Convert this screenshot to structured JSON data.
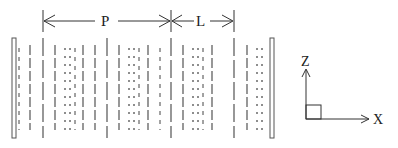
{
  "diagram": {
    "type": "periodic-layered-structure-schematic",
    "dimension_labels": {
      "period": "P",
      "layer": "L"
    },
    "axes": {
      "vertical": "Z",
      "horizontal": "X"
    },
    "colors": {
      "stroke": "#333333",
      "plate": "#555555",
      "background": "#ffffff"
    },
    "structure": {
      "left_plate_x": 14,
      "right_plate_x": 272,
      "plate_top": 38,
      "plate_bottom": 138,
      "dimension_line_y": 21,
      "tall_markers_x": [
        43,
        107,
        171,
        234
      ],
      "columns": [
        {
          "x": 19,
          "style": "short-dash"
        },
        {
          "x": 30,
          "style": "long-dash"
        },
        {
          "x": 43,
          "style": "long-dash"
        },
        {
          "x": 55,
          "style": "long-dash"
        },
        {
          "x": 65,
          "style": "dot"
        },
        {
          "x": 70,
          "style": "dot"
        },
        {
          "x": 75,
          "style": "short-dash"
        },
        {
          "x": 83,
          "style": "long-dash"
        },
        {
          "x": 95,
          "style": "long-dash"
        },
        {
          "x": 107,
          "style": "long-dash"
        },
        {
          "x": 119,
          "style": "long-dash"
        },
        {
          "x": 129,
          "style": "dot"
        },
        {
          "x": 134,
          "style": "dot"
        },
        {
          "x": 139,
          "style": "short-dash"
        },
        {
          "x": 148,
          "style": "long-dash"
        },
        {
          "x": 160,
          "style": "short-dash"
        },
        {
          "x": 171,
          "style": "long-dash"
        },
        {
          "x": 183,
          "style": "long-dash"
        },
        {
          "x": 193,
          "style": "dot"
        },
        {
          "x": 198,
          "style": "dot"
        },
        {
          "x": 203,
          "style": "short-dash"
        },
        {
          "x": 212,
          "style": "long-dash"
        },
        {
          "x": 234,
          "style": "long-dash"
        },
        {
          "x": 247,
          "style": "long-dash"
        },
        {
          "x": 257,
          "style": "dot"
        },
        {
          "x": 262,
          "style": "dot"
        }
      ]
    }
  }
}
